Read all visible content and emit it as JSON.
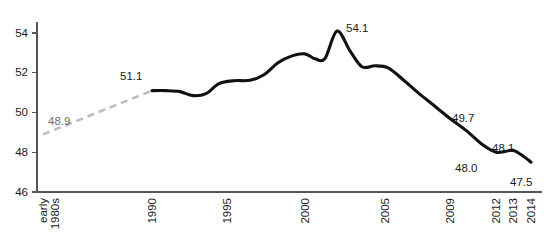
{
  "chart_data": {
    "type": "line",
    "title": "",
    "subtitle": "",
    "xlabel": "",
    "ylabel": "",
    "ylim": [
      46,
      55
    ],
    "yticks": [
      46,
      48,
      50,
      52,
      54
    ],
    "grid": false,
    "legend": false,
    "xtick_labels": [
      "early\n1980s",
      "1990",
      "1995",
      "2000",
      "2005",
      "2009",
      "2012",
      "2013",
      "2014"
    ],
    "xticks": [
      {
        "label_line1": "early",
        "label_line2": "1980s",
        "x": 43
      },
      {
        "label_line1": "1990",
        "label_line2": "",
        "x": 152
      },
      {
        "label_line1": "1995",
        "label_line2": "",
        "x": 227
      },
      {
        "label_line1": "2000",
        "label_line2": "",
        "x": 305
      },
      {
        "label_line1": "2005",
        "label_line2": "",
        "x": 385
      },
      {
        "label_line1": "2009",
        "label_line2": "",
        "x": 450
      },
      {
        "label_line1": "2012",
        "label_line2": "",
        "x": 496
      },
      {
        "label_line1": "2013",
        "label_line2": "",
        "x": 513
      },
      {
        "label_line1": "2014",
        "label_line2": "",
        "x": 531
      }
    ],
    "series": [
      {
        "name": "estimated-early-period",
        "style": "dashed",
        "color": "#bdbdbd",
        "points": [
          {
            "x": 43,
            "y": 48.9
          },
          {
            "x": 152,
            "y": 51.1
          }
        ]
      },
      {
        "name": "observed",
        "style": "solid",
        "color": "#111111",
        "points": [
          {
            "x": 152,
            "y": 51.1
          },
          {
            "x": 166,
            "y": 51.1
          },
          {
            "x": 180,
            "y": 51.05
          },
          {
            "x": 193,
            "y": 50.85
          },
          {
            "x": 206,
            "y": 50.95
          },
          {
            "x": 219,
            "y": 51.45
          },
          {
            "x": 234,
            "y": 51.6
          },
          {
            "x": 250,
            "y": 51.62
          },
          {
            "x": 264,
            "y": 51.9
          },
          {
            "x": 278,
            "y": 52.5
          },
          {
            "x": 292,
            "y": 52.85
          },
          {
            "x": 305,
            "y": 52.95
          },
          {
            "x": 315,
            "y": 52.7
          },
          {
            "x": 325,
            "y": 52.72
          },
          {
            "x": 337,
            "y": 54.1
          },
          {
            "x": 350,
            "y": 53.1
          },
          {
            "x": 362,
            "y": 52.3
          },
          {
            "x": 375,
            "y": 52.35
          },
          {
            "x": 388,
            "y": 52.25
          },
          {
            "x": 402,
            "y": 51.7
          },
          {
            "x": 418,
            "y": 51.0
          },
          {
            "x": 434,
            "y": 50.35
          },
          {
            "x": 450,
            "y": 49.7
          },
          {
            "x": 466,
            "y": 49.1
          },
          {
            "x": 482,
            "y": 48.4
          },
          {
            "x": 496,
            "y": 48.0
          },
          {
            "x": 506,
            "y": 48.05
          },
          {
            "x": 513,
            "y": 48.1
          },
          {
            "x": 522,
            "y": 47.85
          },
          {
            "x": 531,
            "y": 47.5
          }
        ]
      }
    ],
    "annotations": [
      {
        "name": "label-48-9",
        "text": "48.9",
        "x": 48,
        "y": 125,
        "color": "gray"
      },
      {
        "name": "label-51-1",
        "text": "51.1",
        "x": 120,
        "y": 80,
        "color": "dark"
      },
      {
        "name": "label-54-1",
        "text": "54.1",
        "x": 346,
        "y": 32,
        "color": "dark"
      },
      {
        "name": "label-49-7",
        "text": "49.7",
        "x": 452,
        "y": 122,
        "color": "dark"
      },
      {
        "name": "label-48-0",
        "text": "48.0",
        "x": 455,
        "y": 172,
        "color": "dark"
      },
      {
        "name": "label-48-1",
        "text": "48.1",
        "x": 492,
        "y": 152,
        "color": "dark"
      },
      {
        "name": "label-47-5",
        "text": "47.5",
        "x": 510,
        "y": 186,
        "color": "dark"
      }
    ],
    "axis": {
      "y_axis_x": 37,
      "x_axis_y": 192,
      "plot_right": 542,
      "plot_top": 22,
      "y_pixel_at_46": 192,
      "y_pixel_at_54": 33
    },
    "colors": {
      "line": "#111111",
      "estimate": "#bdbdbd",
      "axis": "#555555",
      "text": "#1a1a1a",
      "background": "#ffffff"
    }
  }
}
